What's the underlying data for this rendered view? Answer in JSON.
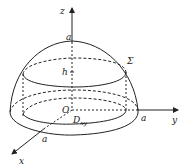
{
  "diagram": {
    "labels": {
      "z_axis": "z",
      "y_axis": "y",
      "x_axis": "x",
      "z_a": "a",
      "y_a": "a",
      "x_a": "a",
      "h": "h",
      "origin": "O",
      "sigma": "Σ",
      "region": "D",
      "region_sub": "xy"
    },
    "colors": {
      "line": "#222222",
      "background": "#ffffff"
    }
  }
}
